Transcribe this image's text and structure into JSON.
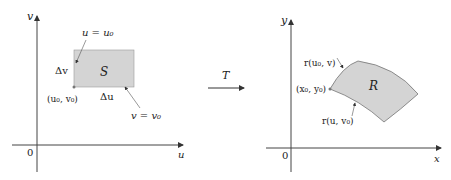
{
  "left": {
    "axis_x": "u",
    "axis_y": "v",
    "origin": "0",
    "region": "S",
    "label_u_eq": "u = u₀",
    "label_v_eq": "v = v₀",
    "label_dv": "Δv",
    "label_du": "Δu",
    "label_corner": "(u₀, v₀)"
  },
  "arrow_label": "T",
  "right": {
    "axis_x": "x",
    "axis_y": "y",
    "origin": "0",
    "region": "R",
    "label_r_u0v": "r(u₀, v)",
    "label_r_uv0": "r(u, v₀)",
    "label_corner": "(x₀, y₀)"
  },
  "colors": {
    "region_fill": "#d4d4d4",
    "stroke": "#333333"
  }
}
